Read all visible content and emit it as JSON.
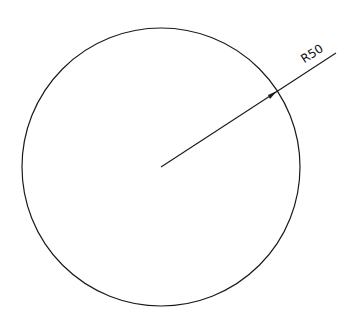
{
  "drawing": {
    "circle": {
      "cx": 161,
      "cy": 167,
      "r": 139,
      "stroke": "#1a1a1a"
    },
    "dimension": {
      "label": "R50",
      "line": {
        "x1": 161,
        "y1": 167,
        "x2": 336,
        "y2": 53
      },
      "arrow_at": {
        "x": 277,
        "y": 91
      },
      "text_angle": -33
    }
  }
}
